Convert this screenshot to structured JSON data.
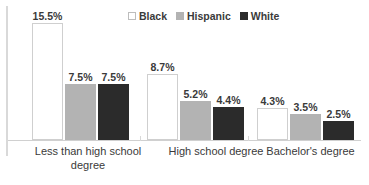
{
  "chart_data": {
    "type": "bar",
    "title": "",
    "xlabel": "",
    "ylabel": "",
    "ylim": [
      0,
      17
    ],
    "grid": false,
    "legend_position": "top-center",
    "value_suffix": "%",
    "categories": [
      "Less than high school degree",
      "High school degree",
      "Bachelor's degree"
    ],
    "series": [
      {
        "name": "Black",
        "swatch": "open",
        "color": "#ffffff",
        "border_color": "#cfcfcf",
        "values": [
          15.5,
          8.7,
          4.3
        ],
        "labels": [
          "15.5%",
          "8.7%",
          "4.3%"
        ]
      },
      {
        "name": "Hispanic",
        "swatch": "gray",
        "color": "#b3b3b3",
        "border_color": "#b3b3b3",
        "values": [
          7.5,
          5.2,
          3.5
        ],
        "labels": [
          "7.5%",
          "5.2%",
          "3.5%"
        ]
      },
      {
        "name": "White",
        "swatch": "dark",
        "color": "#2b2b2b",
        "border_color": "#2b2b2b",
        "values": [
          7.5,
          4.4,
          2.5
        ],
        "labels": [
          "7.5%",
          "4.4%",
          "2.5%"
        ]
      }
    ]
  },
  "legend": {
    "items": [
      {
        "label": "Black"
      },
      {
        "label": "Hispanic"
      },
      {
        "label": "White"
      }
    ]
  },
  "axis": {
    "categories": [
      {
        "line1": "Less than high school",
        "line2": "degree"
      },
      {
        "line1": "High school degree",
        "line2": ""
      },
      {
        "line1": "Bachelor's degree",
        "line2": ""
      }
    ]
  },
  "colors": {
    "series_black": "#ffffff",
    "series_hispanic": "#b3b3b3",
    "series_white": "#2b2b2b",
    "axis": "#d0d0d0",
    "text": "#3a3a3a",
    "background": "#ffffff"
  }
}
